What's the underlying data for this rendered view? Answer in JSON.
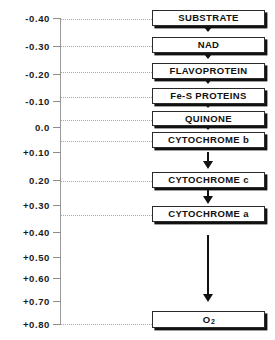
{
  "diagram": {
    "axis": {
      "ticks": [
        {
          "label": "-0.40",
          "y": 18
        },
        {
          "label": "-0.30",
          "y": 46
        },
        {
          "label": "-0.20",
          "y": 74
        },
        {
          "label": "-0.10",
          "y": 101
        },
        {
          "label": "0.0",
          "y": 127
        },
        {
          "label": "+0.10",
          "y": 152
        },
        {
          "label": "0.20",
          "y": 180
        },
        {
          "label": "+0.30",
          "y": 205
        },
        {
          "label": "+0.40",
          "y": 232
        },
        {
          "label": "+0.50",
          "y": 257
        },
        {
          "label": "+0.60",
          "y": 278
        },
        {
          "label": "+0.70",
          "y": 301
        },
        {
          "label": "+0.80",
          "y": 324
        }
      ]
    },
    "nodes": [
      {
        "label": "SUBSTRATE",
        "subscript": "",
        "top": 10,
        "height": 16,
        "leader_y": 19
      },
      {
        "label": "NAD",
        "subscript": "",
        "top": 37,
        "height": 16,
        "leader_y": 46
      },
      {
        "label": "FLAVOPROTEIN",
        "subscript": "",
        "top": 63,
        "height": 16,
        "leader_y": 72
      },
      {
        "label": "Fe-S PROTEINS",
        "subscript": "",
        "top": 88,
        "height": 16,
        "leader_y": 97
      },
      {
        "label": "QUINONE",
        "subscript": "",
        "top": 111,
        "height": 15,
        "leader_y": 120
      },
      {
        "label": "CYTOCHROME b",
        "subscript": "",
        "top": 132,
        "height": 16,
        "leader_y": 141
      },
      {
        "label": "CYTOCHROME c",
        "subscript": "",
        "top": 172,
        "height": 16,
        "leader_y": 181
      },
      {
        "label": "CYTOCHROME a",
        "subscript": "",
        "top": 206,
        "height": 16,
        "leader_y": 215
      },
      {
        "label": "O",
        "subscript": "2",
        "top": 311,
        "height": 17,
        "leader_y": 324
      }
    ],
    "arrows": [
      {
        "type": "small",
        "top": 27,
        "left": 204
      },
      {
        "type": "small",
        "top": 54,
        "left": 204
      },
      {
        "type": "small",
        "top": 79,
        "left": 204
      },
      {
        "type": "small",
        "top": 103,
        "left": 204
      },
      {
        "type": "small",
        "top": 125,
        "left": 204
      },
      {
        "type": "long",
        "top": 152,
        "left": 204,
        "stem_height": 11,
        "head_top": 161
      },
      {
        "type": "long",
        "top": 190,
        "left": 204,
        "stem_height": 8,
        "head_top": 196
      },
      {
        "type": "long",
        "top": 235,
        "left": 204,
        "stem_height": 62,
        "head_top": 294
      }
    ],
    "chart_data": {
      "type": "diagram",
      "title": "Electron transport chain with standard redox potentials (volts)",
      "ylabel": "E°' (volts)",
      "axis_range": [
        -0.4,
        0.8
      ],
      "components": [
        {
          "name": "SUBSTRATE",
          "potential": -0.4
        },
        {
          "name": "NAD",
          "potential": -0.3
        },
        {
          "name": "FLAVOPROTEIN",
          "potential": -0.21
        },
        {
          "name": "Fe-S PROTEINS",
          "potential": -0.11
        },
        {
          "name": "QUINONE",
          "potential": -0.03
        },
        {
          "name": "CYTOCHROME b",
          "potential": 0.05
        },
        {
          "name": "CYTOCHROME c",
          "potential": 0.22
        },
        {
          "name": "CYTOCHROME a",
          "potential": 0.34
        },
        {
          "name": "O2",
          "potential": 0.8
        }
      ]
    }
  }
}
